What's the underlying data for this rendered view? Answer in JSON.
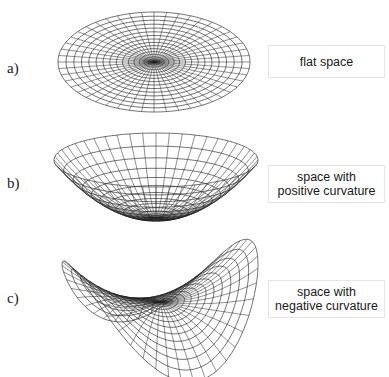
{
  "figure": {
    "panels": [
      {
        "id": "a",
        "label": "a)",
        "caption_lines": [
          "flat space"
        ],
        "surface_type": "flat",
        "label_pos": [
          7,
          61
        ],
        "box": {
          "x": 268,
          "y": 45,
          "w": 117,
          "h": 33
        },
        "surface": {
          "cx": 154,
          "cy": 62,
          "rx": 96,
          "ry": 50,
          "rings": 16,
          "spokes": 48
        }
      },
      {
        "id": "b",
        "label": "b)",
        "caption_lines": [
          "space with",
          "positive curvature"
        ],
        "surface_type": "positive-curvature",
        "label_pos": [
          7,
          176
        ],
        "box": {
          "x": 268,
          "y": 165,
          "w": 117,
          "h": 38
        },
        "surface": {
          "cx": 156,
          "cy": 160,
          "rx": 102,
          "ry": 27,
          "depth": 58,
          "rings": 14,
          "spokes": 48
        }
      },
      {
        "id": "c",
        "label": "c)",
        "caption_lines": [
          "space with",
          "negative curvature"
        ],
        "surface_type": "negative-curvature",
        "label_pos": [
          7,
          291
        ],
        "box": {
          "x": 268,
          "y": 280,
          "w": 117,
          "h": 38
        },
        "surface": {
          "cx": 160,
          "cy": 296,
          "scale": 100,
          "rings": 14,
          "spokes": 48
        }
      }
    ],
    "colors": {
      "line": "#222222",
      "box_border": "#e4e4e4",
      "text": "#1a1a1a"
    }
  }
}
